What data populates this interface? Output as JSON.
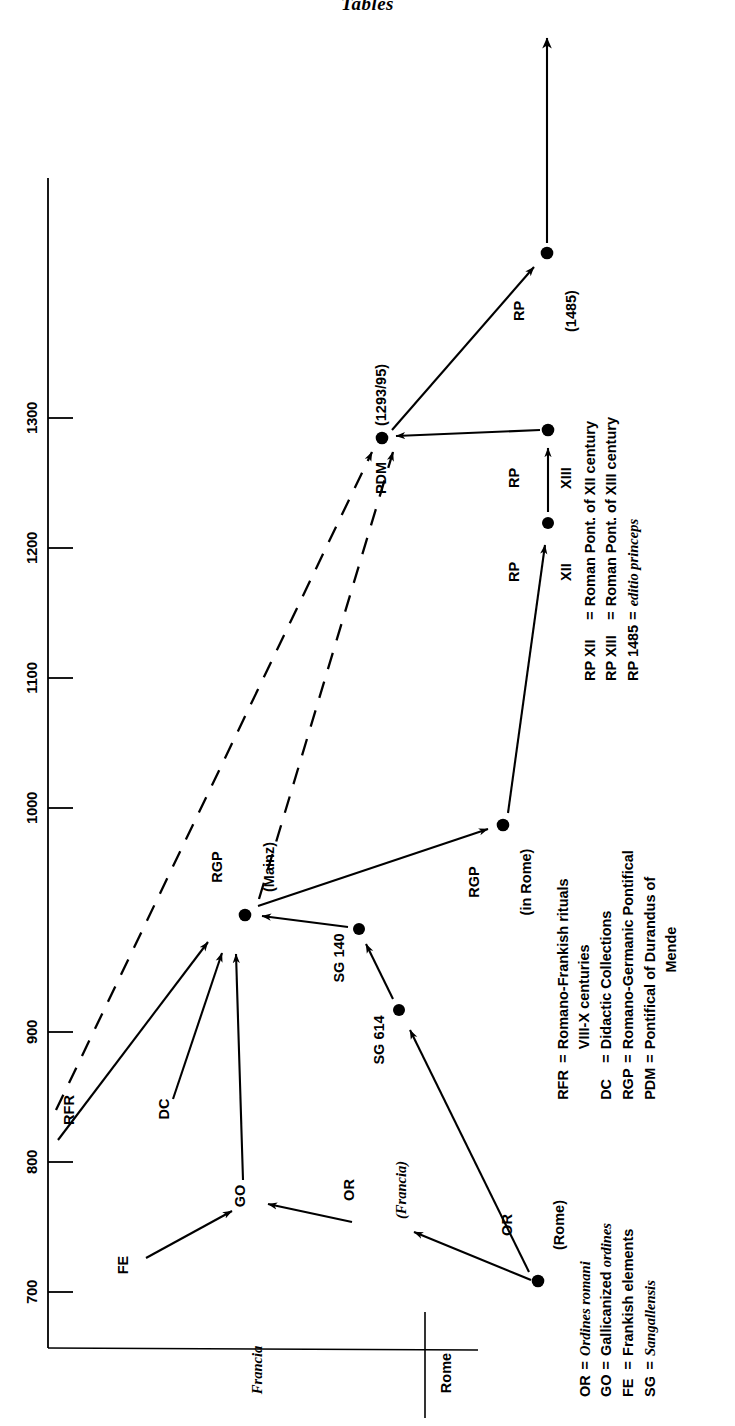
{
  "page": {
    "running_head": "Tables",
    "background": "#ffffff",
    "ink": "#000000"
  },
  "chart_data": {
    "type": "diagram",
    "title": "Tables",
    "orientation": "rotated-90-ccw",
    "xlabel": "",
    "ylabel": "",
    "axis": {
      "time_axis_label": "",
      "ticks": [
        "700",
        "800",
        "900",
        "1000",
        "1100",
        "1200",
        "1300"
      ],
      "tick_values": [
        700,
        800,
        900,
        1000,
        1100,
        1200,
        1300
      ],
      "range": [
        660,
        1360
      ],
      "grid": false
    },
    "place_axis": {
      "labels": [
        "Francia",
        "Rome"
      ],
      "label_styles": [
        "italic",
        "bold"
      ]
    },
    "nodes": [
      {
        "id": "FE",
        "label": "FE",
        "sublabel": "",
        "date": 715,
        "place": "Francia",
        "has_dot": false
      },
      {
        "id": "GO",
        "label": "GO",
        "sublabel": "",
        "date": 768,
        "place": "Francia",
        "has_dot": false
      },
      {
        "id": "OR_Francia",
        "label": "OR",
        "sublabel": "(Francia)",
        "date": 757,
        "place": "Francia-Rome",
        "has_dot": false
      },
      {
        "id": "OR_Rome",
        "label": "OR",
        "sublabel": "(Rome)",
        "date": 710,
        "place": "Rome",
        "has_dot": true
      },
      {
        "id": "RFR",
        "label": "RFR",
        "sublabel": "",
        "date": 830,
        "place": "Francia",
        "has_dot": false
      },
      {
        "id": "DC",
        "label": "DC",
        "sublabel": "",
        "date": 855,
        "place": "Francia",
        "has_dot": false
      },
      {
        "id": "SG614",
        "label": "SG 614",
        "sublabel": "",
        "date": 915,
        "place": "Francia-Rome",
        "has_dot": true
      },
      {
        "id": "SG140",
        "label": "SG 140",
        "sublabel": "",
        "date": 952,
        "place": "Francia-Rome",
        "has_dot": true
      },
      {
        "id": "RGP_Mainz",
        "label": "RGP",
        "sublabel": "(Mainz)",
        "date": 950,
        "place": "Francia",
        "has_dot": true
      },
      {
        "id": "RGP_Rome",
        "label": "RGP",
        "sublabel": "(in Rome)",
        "date": 1000,
        "place": "Rome",
        "has_dot": true
      },
      {
        "id": "RP_XII",
        "label": "RP",
        "sublabel": "XII",
        "date": 1220,
        "place": "Rome",
        "has_dot": true
      },
      {
        "id": "RP_XIII",
        "label": "RP",
        "sublabel": "XIII",
        "date": 1292,
        "place": "Rome",
        "has_dot": true
      },
      {
        "id": "PDM",
        "label": "PDM",
        "sublabel": "(1293/95)",
        "date": 1294,
        "place": "Francia-Rome",
        "has_dot": true
      },
      {
        "id": "RP_1485",
        "label": "RP",
        "sublabel": "(1485)",
        "date": 1485,
        "place": "Rome",
        "has_dot": true
      }
    ],
    "edges": [
      {
        "from": "FE",
        "to": "GO",
        "style": "solid"
      },
      {
        "from": "OR_Francia",
        "to": "GO",
        "style": "solid"
      },
      {
        "from": "OR_Rome",
        "to": "OR_Francia",
        "style": "solid"
      },
      {
        "from": "GO",
        "to": "RGP_Mainz",
        "style": "solid"
      },
      {
        "from": "DC",
        "to": "RGP_Mainz",
        "style": "solid"
      },
      {
        "from": "RFR",
        "to": "RGP_Mainz",
        "style": "solid"
      },
      {
        "from": "SG140",
        "to": "RGP_Mainz",
        "style": "solid"
      },
      {
        "from": "OR_Rome",
        "to": "SG614",
        "style": "solid"
      },
      {
        "from": "SG614",
        "to": "SG140",
        "style": "solid"
      },
      {
        "from": "RGP_Mainz",
        "to": "RGP_Rome",
        "style": "solid"
      },
      {
        "from": "RGP_Rome",
        "to": "RP_XII",
        "style": "solid"
      },
      {
        "from": "RP_XII",
        "to": "RP_XIII",
        "style": "solid"
      },
      {
        "from": "RP_XIII",
        "to": "PDM",
        "style": "solid"
      },
      {
        "from": "RFR",
        "to": "PDM",
        "style": "dashed"
      },
      {
        "from": "RGP_Mainz",
        "to": "PDM",
        "style": "dashed"
      },
      {
        "from": "PDM",
        "to": "RP_1485",
        "style": "solid"
      },
      {
        "from": "RP_1485",
        "to": "beyond",
        "style": "solid-open-arrow"
      }
    ],
    "legend_upper": {
      "entries": [
        {
          "key": "RP XII",
          "eq": "=",
          "value": "Roman Pont. of XII century"
        },
        {
          "key": "RP XIII",
          "eq": "=",
          "value": "Roman Pont. of XIII century"
        },
        {
          "key": "RP 1485",
          "eq": "=",
          "value": "editio princeps",
          "value_style": "italic"
        }
      ]
    },
    "legend_middle": {
      "entries": [
        {
          "key": "RFR",
          "eq": "=",
          "value": "Romano-Frankish rituals",
          "value2": "VIII-X centuries"
        },
        {
          "key": "DC",
          "eq": "=",
          "value": "Didactic Collections"
        },
        {
          "key": "RGP",
          "eq": "=",
          "value": "Romano-Germanic Pontifical"
        },
        {
          "key": "PDM",
          "eq": "=",
          "value": "Pontifical of Durandus of",
          "value2": "Mende"
        }
      ]
    },
    "legend_lower": {
      "entries": [
        {
          "key": "OR",
          "eq": "=",
          "value": "Ordines romani",
          "value_style": "italic"
        },
        {
          "key": "GO",
          "eq": "=",
          "value": "Gallicanized ordines",
          "value_style": "mixed"
        },
        {
          "key": "FE",
          "eq": "=",
          "value": "Frankish elements"
        },
        {
          "key": "SG",
          "eq": "=",
          "value": "Sangallensis",
          "value_style": "italic"
        }
      ]
    }
  }
}
